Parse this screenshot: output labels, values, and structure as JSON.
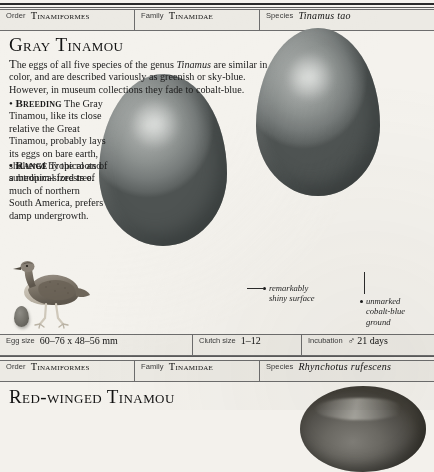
{
  "page": {
    "background_color": "#f4f2ed",
    "ink_color": "#1a1a1a"
  },
  "records": [
    {
      "taxonomy": {
        "order_label": "Order",
        "order_value": "Tinamiformes",
        "family_label": "Family",
        "family_value": "Tinamidae",
        "species_label": "Species",
        "species_value": "Tinamus tao"
      },
      "headline": "Gray Tinamou",
      "intro": {
        "lead_char": "T",
        "part1": "he eggs of all five species of the genus ",
        "genus_italic": "Tinamus",
        "part2": " are similar in color, and are described variously as greenish or sky-blue. However, in museum collections they fade to cobalt-blue."
      },
      "sections": [
        {
          "bullet": "•",
          "tag": "Breeding",
          "text": "The Gray Tinamou, like its close relative the Great Tinamou, probably lays its eggs on bare earth, sheltered by the roots of a medium-sized tree."
        },
        {
          "bullet": "•",
          "tag": "Range",
          "text": "Tropical and subtropical forests of much of northern South America, prefers damp undergrowth."
        }
      ],
      "callouts": [
        {
          "marker": "•",
          "line1": "remarkably",
          "line2": "shiny surface"
        },
        {
          "marker": "•",
          "line1": "unmarked",
          "line2": "cobalt-blue",
          "line3": "ground"
        }
      ],
      "measurements": {
        "egg_size_label": "Egg size",
        "egg_size_value": "60–76 x 48–56 mm",
        "clutch_size_label": "Clutch size",
        "clutch_size_value": "1–12",
        "incubation_label": "Incubation",
        "incubation_symbol": "♂",
        "incubation_value": "21 days"
      }
    },
    {
      "taxonomy": {
        "order_label": "Order",
        "order_value": "Tinamiformes",
        "family_label": "Family",
        "family_value": "Tinamidae",
        "species_label": "Species",
        "species_value": "Rhynchotus rufescens"
      },
      "headline": "Red-winged Tinamou"
    }
  ],
  "figures": {
    "bird_illustration": "gray-tinamou-bird",
    "egg_large": "gray-tinamou-egg-front",
    "egg_right": "gray-tinamou-egg-back",
    "mini_egg": "scale-reference-egg",
    "egg_bottom": "red-winged-tinamou-egg"
  }
}
